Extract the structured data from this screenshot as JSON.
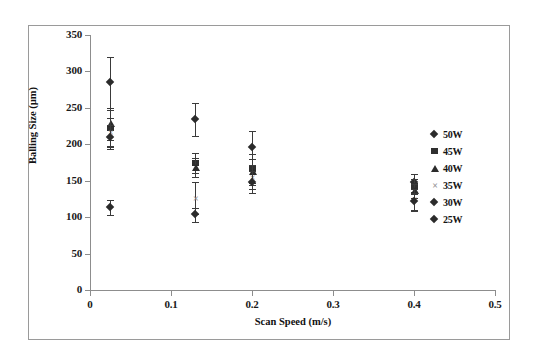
{
  "chart_data": {
    "type": "scatter",
    "title": "",
    "xlabel": "Scan Speed (m/s)",
    "ylabel": "Balling Size (µm)",
    "xlim": [
      0,
      0.5
    ],
    "ylim": [
      0,
      350
    ],
    "xticks": [
      "0",
      "0.1",
      "0.2",
      "0.3",
      "0.4",
      "0.5"
    ],
    "yticks": [
      "0",
      "50",
      "100",
      "150",
      "200",
      "250",
      "300",
      "350"
    ],
    "grid": false,
    "legend_position": "right",
    "legend": [
      "50W",
      "45W",
      "40W",
      "35W",
      "30W",
      "25W"
    ],
    "markers": {
      "50W": "diamond",
      "45W": "square",
      "40W": "triangle",
      "35W": "cross",
      "30W": "diamond",
      "25W": "diamond"
    },
    "series": [
      {
        "name": "50W",
        "marker": "diamond",
        "points": [
          {
            "x": 0.025,
            "y": 285,
            "yerr_low": 35,
            "yerr_high": 35
          },
          {
            "x": 0.13,
            "y": 234,
            "yerr_low": 22,
            "yerr_high": 22
          },
          {
            "x": 0.2,
            "y": 195,
            "yerr_low": 23,
            "yerr_high": 23
          },
          {
            "x": 0.4,
            "y": 147,
            "yerr_low": 12,
            "yerr_high": 12
          }
        ]
      },
      {
        "name": "45W",
        "marker": "square",
        "points": [
          {
            "x": 0.025,
            "y": 222,
            "yerr_low": 25,
            "yerr_high": 25
          },
          {
            "x": 0.13,
            "y": 174,
            "yerr_low": 14,
            "yerr_high": 14
          },
          {
            "x": 0.2,
            "y": 167,
            "yerr_low": 20,
            "yerr_high": 20
          },
          {
            "x": 0.4,
            "y": 142,
            "yerr_low": 10,
            "yerr_high": 10
          }
        ]
      },
      {
        "name": "40W",
        "marker": "triangle",
        "points": [
          {
            "x": 0.025,
            "y": 228,
            "yerr_low": 22,
            "yerr_high": 22
          },
          {
            "x": 0.13,
            "y": 168,
            "yerr_low": 13,
            "yerr_high": 13
          },
          {
            "x": 0.2,
            "y": 162,
            "yerr_low": 18,
            "yerr_high": 18
          },
          {
            "x": 0.4,
            "y": 136,
            "yerr_low": 10,
            "yerr_high": 10
          }
        ]
      },
      {
        "name": "35W",
        "marker": "cross",
        "points": [
          {
            "x": 0.025,
            "y": 216,
            "yerr_low": 20,
            "yerr_high": 20
          },
          {
            "x": 0.13,
            "y": 126,
            "yerr_low": 22,
            "yerr_high": 22
          },
          {
            "x": 0.2,
            "y": 155,
            "yerr_low": 16,
            "yerr_high": 16
          },
          {
            "x": 0.4,
            "y": 124,
            "yerr_low": 14,
            "yerr_high": 14
          }
        ]
      },
      {
        "name": "30W",
        "marker": "diamond",
        "points": [
          {
            "x": 0.025,
            "y": 210,
            "yerr_low": 16,
            "yerr_high": 16
          },
          {
            "x": 0.13,
            "y": 103,
            "yerr_low": 10,
            "yerr_high": 10
          },
          {
            "x": 0.2,
            "y": 148,
            "yerr_low": 15,
            "yerr_high": 15
          },
          {
            "x": 0.4,
            "y": 121,
            "yerr_low": 12,
            "yerr_high": 12
          }
        ]
      },
      {
        "name": "25W",
        "marker": "diamond",
        "points": [
          {
            "x": 0.025,
            "y": 113,
            "yerr_low": 10,
            "yerr_high": 10
          }
        ]
      }
    ]
  },
  "axes": {
    "x_title": "Scan Speed (m/s)",
    "y_title": "Balling Size (µm)",
    "x_tick_labels": [
      "0",
      "0.1",
      "0.2",
      "0.3",
      "0.4",
      "0.5"
    ],
    "y_tick_labels": [
      "350",
      "300",
      "250",
      "200",
      "150",
      "100",
      "50",
      "0"
    ]
  },
  "legend": {
    "entries": [
      {
        "label": "50W",
        "marker": "diamond-icon"
      },
      {
        "label": "45W",
        "marker": "square-icon"
      },
      {
        "label": "40W",
        "marker": "triangle-icon"
      },
      {
        "label": "35W",
        "marker": "cross-icon"
      },
      {
        "label": "30W",
        "marker": "diamond-icon"
      },
      {
        "label": "25W",
        "marker": "diamond-icon"
      }
    ]
  },
  "style": {
    "background": "#ffffff",
    "frame_color": "#9a9a9a",
    "axis_color": "#8d8d8d",
    "marker_color": "#2b2b2b",
    "cross_color": "#8f8f8f"
  }
}
